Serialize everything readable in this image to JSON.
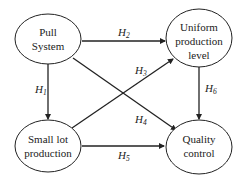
{
  "diagram": {
    "nodes": [
      {
        "id": "pull",
        "lines": [
          "Pull",
          "System"
        ]
      },
      {
        "id": "uniform",
        "lines": [
          "Uniform",
          "production",
          "level"
        ]
      },
      {
        "id": "smalllot",
        "lines": [
          "Small lot",
          "production"
        ]
      },
      {
        "id": "quality",
        "lines": [
          "Quality",
          "control"
        ]
      }
    ],
    "edges": [
      {
        "id": "H1",
        "from": "pull",
        "to": "smalllot",
        "label": "H",
        "sub": "1"
      },
      {
        "id": "H2",
        "from": "pull",
        "to": "uniform",
        "label": "H",
        "sub": "2"
      },
      {
        "id": "H3",
        "from": "smalllot",
        "to": "uniform",
        "label": "H",
        "sub": "3"
      },
      {
        "id": "H4",
        "from": "pull",
        "to": "quality",
        "label": "H",
        "sub": "4"
      },
      {
        "id": "H5",
        "from": "smalllot",
        "to": "quality",
        "label": "H",
        "sub": "5"
      },
      {
        "id": "H6",
        "from": "uniform",
        "to": "quality",
        "label": "H",
        "sub": "6"
      }
    ]
  }
}
